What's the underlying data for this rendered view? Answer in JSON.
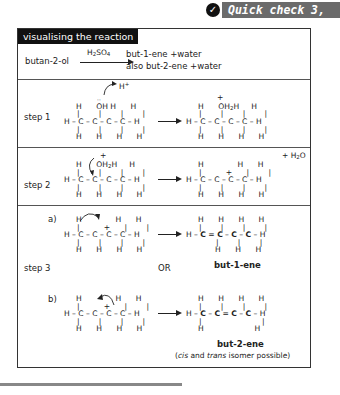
{
  "quick_check": {
    "icon": "check-icon",
    "label": "Quick check 3, 4"
  },
  "panel": {
    "title": "visualising the reaction",
    "equation": {
      "reactant": "butan-2-ol",
      "catalyst": "H₂SO₄",
      "product_line1": "but-1-ene +water",
      "product_line2": "also but-2-ene +water"
    },
    "step1": {
      "label": "step 1",
      "proton": "H⁺",
      "left_rows": [
        "H   ÖH H    H",
        "H–C–C–C–C–H",
        "H   H    H    H"
      ],
      "right_rows": [
        "H   ⁺OH₂H    H",
        "H–C–C–C–C–H",
        "H   H    H    H"
      ]
    },
    "step2": {
      "label": "step 2",
      "side_product": "+ H₂O",
      "left_rows": [
        "H  ⁺OH₂H    H",
        "H–C–C–C–C–H",
        "H   H    H    H"
      ],
      "right_rows": [
        "H         H    H",
        "H–C–C⁺–C–C–H",
        "H   H    H    H"
      ]
    },
    "step3": {
      "label": "step 3",
      "or_label": "OR",
      "a": {
        "label": "a)",
        "left_rows": [
          "H         H    H",
          "H–C–C⁺–C–C–H",
          "H   H    H    H"
        ],
        "right_rows": [
          "H   H    H    H",
          "H–C=C–C–C–H",
          "H    H    H"
        ],
        "product": "but-1-ene"
      },
      "b": {
        "label": "b)",
        "left_rows": [
          "H         H    H",
          "H–C–C⁺–C–C–H",
          "H   H    H    H"
        ],
        "right_rows": [
          "H   H    H    H",
          "H–C–C=C–C–H",
          "H              H"
        ],
        "product": "but-2-ene",
        "note": "(cis and trans isomer possible)"
      }
    }
  }
}
